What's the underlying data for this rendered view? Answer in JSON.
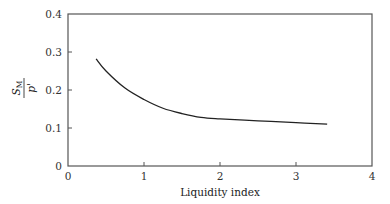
{
  "chart_data": {
    "type": "line",
    "title": "",
    "xlabel": "Liquidity index",
    "ylabel": "S_M / p'",
    "ylabel_parts": {
      "numerator": "S",
      "numerator_sub": "M",
      "denominator": "p'"
    },
    "xlim": [
      0,
      4
    ],
    "ylim": [
      0,
      0.4
    ],
    "xticks": [
      0,
      1,
      2,
      3,
      4
    ],
    "xtick_labels": [
      "0",
      "1",
      "2",
      "3",
      "4"
    ],
    "yticks": [
      0,
      0.1,
      0.2,
      0.3,
      0.4
    ],
    "ytick_labels": [
      "0",
      "0.1",
      "0.2",
      "0.3",
      "0.4"
    ],
    "grid": false,
    "legend": null,
    "series": [
      {
        "name": "S_M/p' vs liquidity index",
        "color": "#222222",
        "x": [
          0.37,
          0.5,
          0.75,
          1.0,
          1.25,
          1.5,
          1.75,
          2.0,
          2.5,
          3.0,
          3.41
        ],
        "y": [
          0.282,
          0.25,
          0.205,
          0.175,
          0.152,
          0.138,
          0.128,
          0.124,
          0.119,
          0.114,
          0.11
        ]
      }
    ]
  },
  "plot_area": {
    "left": 68,
    "top": 14,
    "right": 372,
    "bottom": 166
  },
  "colors": {
    "axis": "#555555",
    "line": "#222222",
    "text": "#333333"
  }
}
